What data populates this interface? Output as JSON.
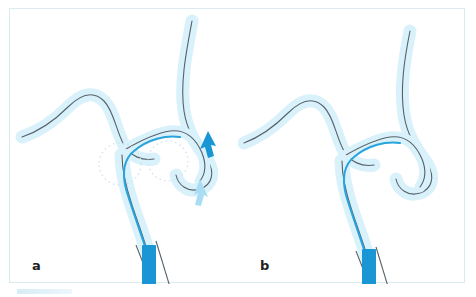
{
  "figure": {
    "kind": "medical-illustration",
    "panel_count": 2,
    "colors": {
      "vessel_outline": "#55626b",
      "vessel_fill": "#d9f1fa",
      "vessel_fill_light": "#e8f7fc",
      "guidewire": "#29a3dc",
      "catheter_solid": "#1b96d5",
      "arrow_strong": "#1b96d5",
      "arrow_soft": "#a9ddf3",
      "stenosis_marker": "#cfe3ee",
      "frame_border": "#dbeaf0",
      "label_text": "#231f20",
      "background": "#ffffff"
    },
    "panels": [
      {
        "id": "a",
        "label": "a",
        "description": "Pre-treatment: stenosis marked by two dotted circles at the vessel junction, with a solid blue arrow indicating advancement direction and a pale blue arrow indicating the opposing flow or withdrawal direction.",
        "markers": {
          "dotted_circles": 2,
          "arrows": [
            {
              "name": "advance-arrow",
              "style": "solid",
              "color": "#1b96d5",
              "direction": "down-right"
            },
            {
              "name": "recoil-arrow",
              "style": "soft",
              "color": "#a9ddf3",
              "direction": "up-left"
            }
          ]
        },
        "catheter_tip": {
          "shape": "rectangle",
          "color": "#1b96d5"
        }
      },
      {
        "id": "b",
        "label": "b",
        "description": "Post-treatment: the vessel junction is patent, the stenosis markers and arrows are absent, and the guidewire passes smoothly through the reconstructed lumen.",
        "markers": {
          "dotted_circles": 0,
          "arrows": []
        },
        "catheter_tip": {
          "shape": "rectangle",
          "color": "#1b96d5"
        }
      }
    ]
  }
}
